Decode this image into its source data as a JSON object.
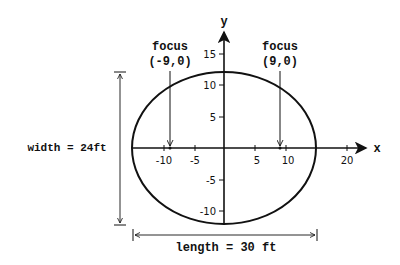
{
  "diagram": {
    "type": "ellipse-on-axes",
    "axes": {
      "x_label": "x",
      "y_label": "y",
      "x_ticks": [
        {
          "value": -10,
          "label": "-10"
        },
        {
          "value": -5,
          "label": "-5"
        },
        {
          "value": 5,
          "label": "5"
        },
        {
          "value": 10,
          "label": "10"
        },
        {
          "value": 20,
          "label": "20"
        }
      ],
      "y_ticks": [
        {
          "value": 15,
          "label": "15"
        },
        {
          "value": 10,
          "label": "10"
        },
        {
          "value": 5,
          "label": "5"
        },
        {
          "value": -5,
          "label": "-5"
        },
        {
          "value": -10,
          "label": "-10"
        }
      ]
    },
    "ellipse": {
      "center": [
        0,
        0
      ],
      "semi_major_x": 15,
      "semi_minor_y": 12
    },
    "foci": [
      {
        "title": "focus",
        "coord": "(-9,0)",
        "x": -9,
        "y": 0
      },
      {
        "title": "focus",
        "coord": "(9,0)",
        "x": 9,
        "y": 0
      }
    ],
    "dimensions": {
      "width_label": "width = 24ft",
      "length_label": "length = 30 ft"
    },
    "colors": {
      "stroke": "#111111",
      "background": "#ffffff"
    }
  }
}
